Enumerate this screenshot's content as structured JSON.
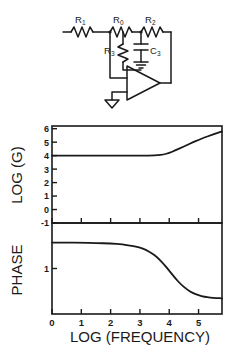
{
  "figure": {
    "caption": ""
  },
  "circuit": {
    "title": "operational-amplifier-network",
    "components": [
      {
        "id": "R1",
        "label": "R",
        "sub": "1",
        "type": "resistor",
        "orientation": "horizontal"
      },
      {
        "id": "R0",
        "label": "R",
        "sub": "0",
        "type": "resistor",
        "orientation": "horizontal"
      },
      {
        "id": "R2",
        "label": "R",
        "sub": "2",
        "type": "resistor",
        "orientation": "horizontal"
      },
      {
        "id": "R3",
        "label": "R",
        "sub": "3",
        "type": "resistor",
        "orientation": "vertical"
      },
      {
        "id": "C3",
        "label": "C",
        "sub": "3",
        "type": "capacitor",
        "orientation": "vertical"
      },
      {
        "id": "U1",
        "label": "",
        "sub": "",
        "type": "opamp",
        "orientation": "right"
      }
    ],
    "grounds": 2
  },
  "chart_data": [
    {
      "type": "line",
      "name": "gain-plot",
      "title": "",
      "xlabel": "LOG (FREQUENCY)",
      "ylabel": "LOG (G)",
      "xlim": [
        0,
        5.8
      ],
      "ylim": [
        -1,
        6.2
      ],
      "xticks": [
        0,
        1,
        2,
        3,
        4,
        5
      ],
      "xticklabels": [
        "",
        "",
        "",
        "",
        "",
        ""
      ],
      "yticks": [
        -1,
        0,
        1,
        2,
        3,
        4,
        5,
        6
      ],
      "yticklabels": [
        "-1",
        "0",
        "1",
        "2",
        "3",
        "4",
        "5",
        "6"
      ],
      "grid": false,
      "legend": "none",
      "series": [
        {
          "name": "log gain",
          "x": [
            0.0,
            0.5,
            1.0,
            1.5,
            2.0,
            2.5,
            3.0,
            3.2,
            3.4,
            3.6,
            3.8,
            4.0,
            4.2,
            4.4,
            4.6,
            4.8,
            5.0,
            5.2,
            5.4,
            5.6,
            5.8
          ],
          "y": [
            4.0,
            4.0,
            4.0,
            4.0,
            4.0,
            4.0,
            4.0,
            4.0,
            4.01,
            4.03,
            4.08,
            4.2,
            4.38,
            4.58,
            4.78,
            4.98,
            5.17,
            5.34,
            5.5,
            5.66,
            5.8
          ]
        }
      ]
    },
    {
      "type": "line",
      "name": "phase-plot",
      "title": "",
      "xlabel": "LOG (FREQUENCY)",
      "ylabel": "PHASE",
      "xlim": [
        0,
        5.8
      ],
      "ylim": [
        0,
        2.0
      ],
      "xticks": [
        0,
        1,
        2,
        3,
        4,
        5
      ],
      "xticklabels": [
        "0",
        "1",
        "2",
        "3",
        "4",
        "5"
      ],
      "yticks": [
        1
      ],
      "yticklabels": [
        "1"
      ],
      "grid": false,
      "legend": "none",
      "series": [
        {
          "name": "phase",
          "x": [
            0.0,
            0.5,
            1.0,
            1.5,
            2.0,
            2.4,
            2.8,
            3.0,
            3.2,
            3.4,
            3.6,
            3.8,
            4.0,
            4.2,
            4.4,
            4.6,
            4.8,
            5.0,
            5.2,
            5.4,
            5.6,
            5.8
          ],
          "y": [
            1.57,
            1.57,
            1.565,
            1.56,
            1.55,
            1.53,
            1.49,
            1.46,
            1.41,
            1.34,
            1.24,
            1.11,
            0.95,
            0.79,
            0.65,
            0.54,
            0.46,
            0.41,
            0.38,
            0.36,
            0.35,
            0.345
          ]
        }
      ]
    }
  ],
  "axis_labels": {
    "gain_y": "LOG (G)",
    "phase_y": "PHASE",
    "x": "LOG (FREQUENCY)"
  },
  "colors": {
    "line": "#1a1a1a",
    "axis": "#1a1a1a",
    "background": "#ffffff"
  }
}
